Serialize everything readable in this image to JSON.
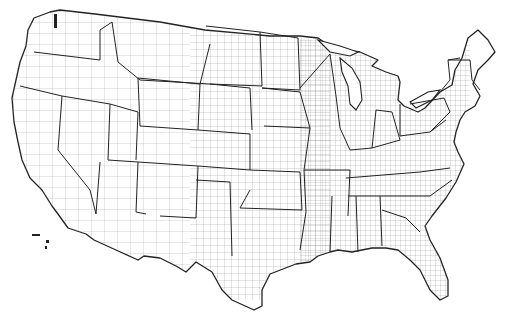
{
  "map": {
    "title": "",
    "subject": "United States county boundaries (contiguous 48 states)",
    "style": {
      "background": "#ffffff",
      "line_color": "#222222",
      "fill": "#ffffff"
    },
    "labels": []
  }
}
